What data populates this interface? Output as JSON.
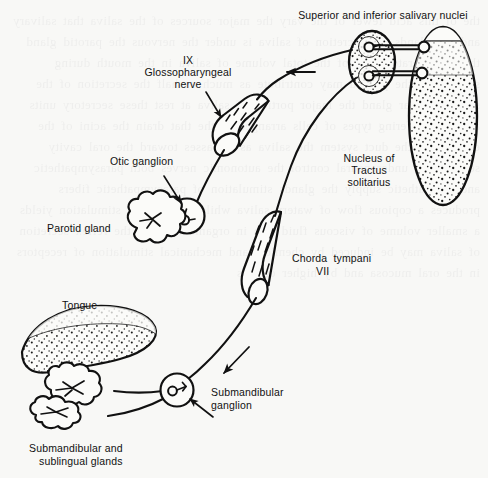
{
  "figure": {
    "background_color": "#f8f8f6",
    "ink_color": "#111111"
  },
  "labels": {
    "salivary_nuclei": "Superior and inferior salivary nuclei",
    "glossopharyngeal_roman": "IX",
    "glossopharyngeal_name": "Glossopharyngeal",
    "glossopharyngeal_nerve": "nerve",
    "otic_ganglion": "Otic ganglion",
    "parotid_gland": "Parotid gland",
    "nucleus_line1": "Nucleus of",
    "nucleus_line2": "Tractus",
    "nucleus_line3": "solitarius",
    "chorda_tympani": "Chorda  tympani",
    "chorda_roman": "VII",
    "tongue": "Tongue",
    "submandibular_ganglion_line1": "Submandibular",
    "submandibular_ganglion_line2": "ganglion",
    "glands_line1": "Submandibular and",
    "glands_line2": "sublingual glands"
  },
  "structures": [
    {
      "name": "superior-and-inferior-salivary-nuclei",
      "shape": "stippled-ellipse",
      "neurons": 2
    },
    {
      "name": "nucleus-of-tractus-solitarius",
      "shape": "stippled-tall-ellipse",
      "neurons": 2
    },
    {
      "name": "glossopharyngeal-nerve-trunk",
      "shape": "cut-cylinder"
    },
    {
      "name": "chorda-tympani-nerve-trunk",
      "shape": "cut-cylinder"
    },
    {
      "name": "otic-ganglion",
      "shape": "circle-with-neuron"
    },
    {
      "name": "submandibular-ganglion",
      "shape": "circle-with-neuron"
    },
    {
      "name": "parotid-gland",
      "shape": "lobulated-gland"
    },
    {
      "name": "submandibular-gland",
      "shape": "lobulated-gland"
    },
    {
      "name": "sublingual-gland",
      "shape": "lobulated-gland"
    },
    {
      "name": "tongue",
      "shape": "stippled-tongue"
    }
  ],
  "arrows": [
    {
      "name": "afferent-flow-arrow-upper",
      "direction": "left"
    },
    {
      "name": "glossopharyngeal-pointer-arrow",
      "direction": "down-right"
    },
    {
      "name": "otic-ganglion-pointer-arrow",
      "direction": "down-right"
    },
    {
      "name": "efferent-flow-arrow-lower",
      "direction": "down-left"
    },
    {
      "name": "submandibular-ganglion-pointer-arrow",
      "direction": "up-left"
    }
  ],
  "bleed_through_text": "the of this acid fewer of the vary the major sources of the saliva that salivary and the glands the secretion of saliva is under the nervous the parotid gland the resting rate about of the total volume of saliva in the mouth during stimulation the parotid may contribute as much as half the secretion of the submandibular gland the major portion of saliva at rest these secretory units are of a differing types of cells arranged in the that drain the acini of the each gland the duct system the saliva as it passes toward the oral cavity secretion is under neural control the autonomic nerves both parasympathetic and sympathetic supply the glands stimulation of parasympathetic fibers produces a copious flow of watery saliva while sympathetic stimulation yields a smaller volume of viscous fluid rich in organic material the reflex secretion of saliva may be induced by chemical and mechanical stimulation of receptors in the oral mucosa and by higher centers"
}
